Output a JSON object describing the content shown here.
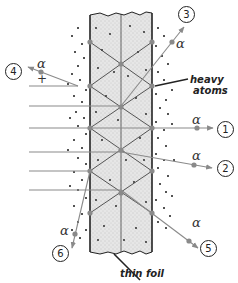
{
  "labels": {
    "heavy_atoms": [
      "heavy",
      "atoms"
    ],
    "thin_foil": "thin foil",
    "alpha": "α",
    "charge": "+"
  },
  "particles": [
    {
      "id": "1",
      "label": "1",
      "deflection": "undeflected",
      "alpha": "α"
    },
    {
      "id": "2",
      "label": "2",
      "deflection": "small angle",
      "alpha": "α"
    },
    {
      "id": "3",
      "label": "3",
      "deflection": "moderate angle upward",
      "alpha": "α"
    },
    {
      "id": "4",
      "label": "4",
      "deflection": "back-scattered",
      "alpha": "α"
    },
    {
      "id": "5",
      "label": "5",
      "deflection": "larger angle downward",
      "alpha": "α"
    },
    {
      "id": "6",
      "label": "6",
      "deflection": "large angle downward (backward side)",
      "alpha": "α"
    }
  ],
  "colors": {
    "foil_fill": "#d9d9d9",
    "foil_edge": "#222222",
    "track": "#8a8a8a",
    "atom": "#8a8a8a",
    "dot": "#1a1a1a"
  }
}
